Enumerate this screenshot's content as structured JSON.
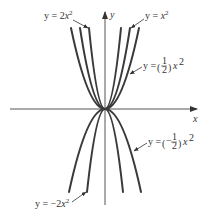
{
  "figure": {
    "type": "family of parabolas y = a x^2",
    "axes": {
      "x_label": "x",
      "y_label": "y"
    },
    "curves": [
      {
        "id": "y-2x2",
        "a": 2,
        "label_prefix": "y = 2",
        "label_var": "x",
        "label_exp": "2",
        "direction": "up"
      },
      {
        "id": "y-x2",
        "a": 1,
        "label_prefix": "y = ",
        "label_var": "x",
        "label_exp": "2",
        "direction": "up"
      },
      {
        "id": "y-half-x2",
        "a": 0.5,
        "label_prefix": "y = ",
        "frac_sign": "",
        "frac_num": "1",
        "frac_den": "2",
        "label_var": "x",
        "label_exp": "2",
        "direction": "up"
      },
      {
        "id": "y-neg-half-x2",
        "a": -0.5,
        "label_prefix": "y = ",
        "frac_sign": "−",
        "frac_num": "1",
        "frac_den": "2",
        "label_var": "x",
        "label_exp": "2",
        "direction": "down"
      },
      {
        "id": "y-neg-2x2",
        "a": -2,
        "label_prefix": "y = −2",
        "label_var": "x",
        "label_exp": "2",
        "direction": "down"
      }
    ],
    "colors": {
      "curve": "#3a3a3a",
      "axis": "#555555",
      "label": "#333333",
      "background": "#ffffff"
    }
  }
}
